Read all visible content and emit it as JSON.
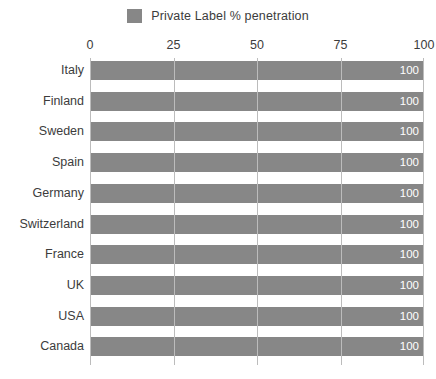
{
  "legend": {
    "swatch_icon": "legend-color-swatch",
    "label": "Private Label % penetration",
    "color": "#878787",
    "position": "top-center"
  },
  "axis": {
    "ticks": [
      "0",
      "25",
      "50",
      "75",
      "100"
    ],
    "tick_values": [
      0,
      25,
      50,
      75,
      100
    ],
    "position": "top"
  },
  "chart_data": {
    "type": "bar",
    "orientation": "horizontal",
    "title": "",
    "subtitle": "",
    "xlabel": "",
    "ylabel": "",
    "xlim": [
      0,
      100
    ],
    "grid": true,
    "legend_position": "top-center",
    "categories": [
      "Italy",
      "Finland",
      "Sweden",
      "Spain",
      "Germany",
      "Switzerland",
      "France",
      "UK",
      "USA",
      "Canada"
    ],
    "series": [
      {
        "name": "Private Label % penetration",
        "color": "#878787",
        "values": [
          100,
          100,
          100,
          100,
          100,
          100,
          100,
          100,
          100,
          100
        ]
      }
    ],
    "data_labels": [
      "100",
      "100",
      "100",
      "100",
      "100",
      "100",
      "100",
      "100",
      "100",
      "100"
    ],
    "xticks": [
      0,
      25,
      50,
      75,
      100
    ],
    "xticklabels": [
      "0",
      "25",
      "50",
      "75",
      "100"
    ]
  },
  "colors": {
    "bar": "#878787",
    "gridline": "#bcbcbc",
    "text": "#3c3c3c",
    "data_label_text": "#ffffff",
    "background": "#ffffff"
  }
}
